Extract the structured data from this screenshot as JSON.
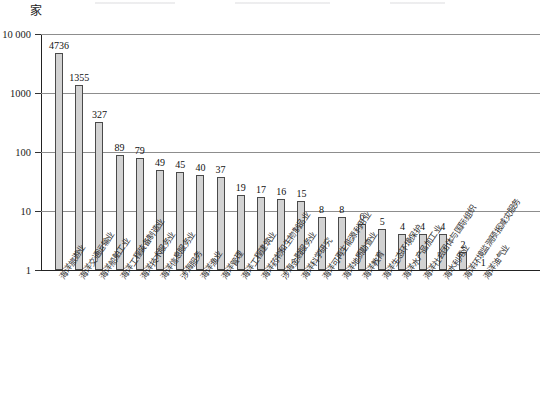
{
  "chart_data": {
    "type": "bar",
    "title": "",
    "subtitle": "",
    "unit_label": "家",
    "xlabel": "",
    "ylabel": "",
    "yscale": "log",
    "ylim": [
      1,
      10000
    ],
    "ytick_labels": [
      "1",
      "10",
      "100",
      "1000",
      "10 000"
    ],
    "ytick_values": [
      1,
      10,
      100,
      1000,
      10000
    ],
    "grid": "horizontal",
    "legend": "none",
    "bar_color": "#d2d2d2",
    "bar_border_color": "#4a4a4a",
    "categories": [
      "海洋旅游业",
      "海洋交通运输业",
      "海洋船舶工业",
      "海洋工程装备制造业",
      "海洋技术服务业",
      "海洋信息服务业",
      "涉海服务",
      "海洋渔业",
      "海洋管理",
      "海洋工程建筑业",
      "海洋药物和生物制品业",
      "涉海金融服务业",
      "海洋科学研究",
      "海洋可再生能源利用业",
      "海洋地质勘查业",
      "海洋教育",
      "海洋生态环境保护",
      "海洋水产品加工业",
      "海洋社会团体与国际组织",
      "海水利用业",
      "海洋环境监测预报减灾服务",
      "海洋油气业"
    ],
    "values": [
      4736,
      1355,
      327,
      89,
      79,
      49,
      45,
      40,
      37,
      19,
      17,
      16,
      15,
      8,
      8,
      6,
      5,
      4,
      4,
      4,
      2,
      1
    ],
    "value_labels": [
      "4736",
      "1355",
      "327",
      "89",
      "79",
      "49",
      "45",
      "40",
      "37",
      "19",
      "17",
      "16",
      "15",
      "8",
      "8",
      "6",
      "5",
      "4",
      "4",
      "4",
      "2",
      "1"
    ]
  }
}
